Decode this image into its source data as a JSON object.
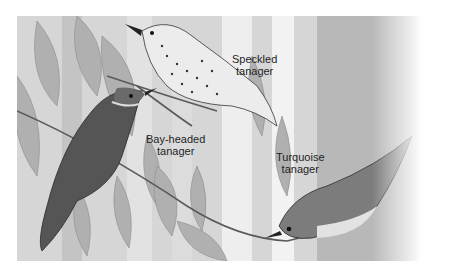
{
  "figure": {
    "labels": [
      {
        "id": "speckled",
        "line1": "Speckled",
        "line2": "tanager"
      },
      {
        "id": "bay-headed",
        "line1": "Bay-headed",
        "line2": "tanager"
      },
      {
        "id": "turquoise",
        "line1": "Turquoise",
        "line2": "tanager"
      }
    ]
  },
  "colors": {
    "background": "#ffffff",
    "leaf": "#b4b4b4",
    "trunk": "#c8c8c8",
    "bird_dark": "#4a4a4a",
    "label_text": "#1e1e1e"
  }
}
